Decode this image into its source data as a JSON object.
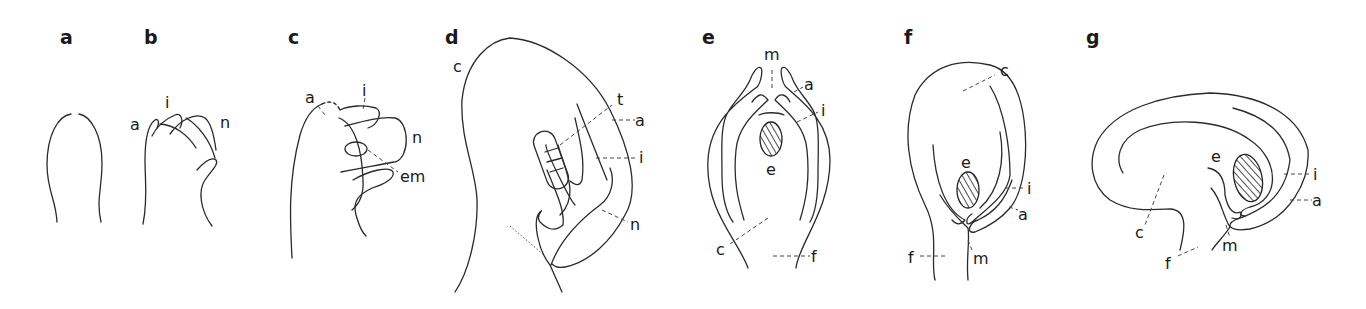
{
  "figure": {
    "panels": [
      {
        "id": "a",
        "letter": "a",
        "labels": []
      },
      {
        "id": "b",
        "letter": "b",
        "labels": [
          "a",
          "i",
          "n"
        ]
      },
      {
        "id": "c",
        "letter": "c",
        "labels": [
          "a",
          "i",
          "n",
          "em"
        ]
      },
      {
        "id": "d",
        "letter": "d",
        "labels": [
          "c",
          "t",
          "a",
          "i",
          "n"
        ]
      },
      {
        "id": "e",
        "letter": "e",
        "labels": [
          "m",
          "a",
          "i",
          "e",
          "c",
          "f"
        ]
      },
      {
        "id": "f",
        "letter": "f",
        "labels": [
          "c",
          "e",
          "i",
          "a",
          "f",
          "m"
        ]
      },
      {
        "id": "g",
        "letter": "g",
        "labels": [
          "e",
          "i",
          "a",
          "c",
          "m",
          "f"
        ]
      }
    ]
  }
}
